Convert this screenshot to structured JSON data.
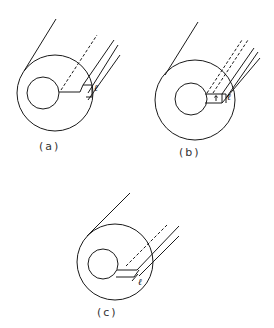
{
  "figure": {
    "panels": [
      {
        "id": "a",
        "caption": "(a)",
        "slot_label": "ℓ",
        "description": "Coaxial cylinder with eccentric inner bore and radial slot extending to outer surface"
      },
      {
        "id": "b",
        "caption": "(b)",
        "slot_label": "ℓ",
        "description": "Coaxial cylinder with slot of measured width"
      },
      {
        "id": "c",
        "caption": "(c)",
        "slot_label": "ℓ",
        "description": "Coaxial cylinder with angled slot"
      }
    ],
    "stroke_color": "#1a1a1a",
    "background": "#ffffff"
  }
}
